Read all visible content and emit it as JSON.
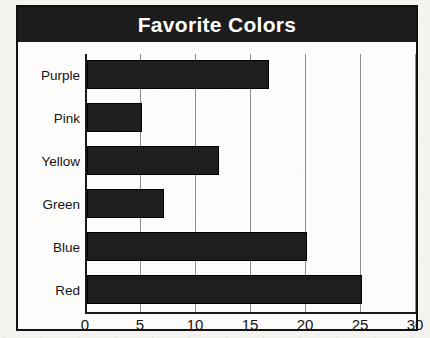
{
  "chart_data": {
    "type": "bar",
    "orientation": "horizontal",
    "title": "Favorite Colors",
    "xlabel": "",
    "ylabel": "",
    "categories": [
      "Purple",
      "Pink",
      "Yellow",
      "Green",
      "Blue",
      "Red"
    ],
    "values": [
      16.5,
      5,
      12,
      7,
      20,
      25
    ],
    "xlim": [
      0,
      30
    ],
    "xticks": [
      0,
      5,
      10,
      15,
      20,
      25,
      30
    ],
    "xtick_labels": [
      "0",
      "5",
      "10",
      "15",
      "20",
      "25",
      "30"
    ],
    "grid": true,
    "grid_axis": "x",
    "legend": false,
    "bar_color": "#1e1e1e",
    "title_background": "#1c1c1c",
    "title_color": "#ffffff",
    "plot_background": "#fdfcfa",
    "frame_color": "#111111"
  }
}
